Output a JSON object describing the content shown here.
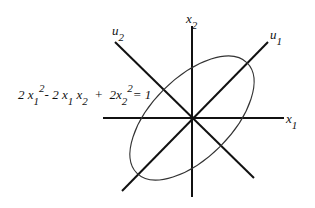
{
  "diagram": {
    "equation": {
      "terms": [
        {
          "coef": "2",
          "var": "x",
          "sub": "1",
          "sup": "2"
        },
        {
          "op": "-"
        },
        {
          "coef": "2",
          "var": "x",
          "sub": "1"
        },
        {
          "var": "x",
          "sub": "2"
        },
        {
          "op": "+"
        },
        {
          "coef": "2",
          "var": "x",
          "sub": "2",
          "sup": "2"
        },
        {
          "op": "= 1"
        }
      ],
      "text": "2x1^2 - 2x1x2 + 2x2^2 = 1"
    },
    "axes": {
      "x1": {
        "var": "x",
        "sub": "1"
      },
      "x2": {
        "var": "x",
        "sub": "2"
      },
      "u1": {
        "var": "u",
        "sub": "1"
      },
      "u2": {
        "var": "u",
        "sub": "2"
      }
    },
    "colors": {
      "stroke": "#111111",
      "ellipse": "#333333",
      "background": "#ffffff"
    }
  }
}
